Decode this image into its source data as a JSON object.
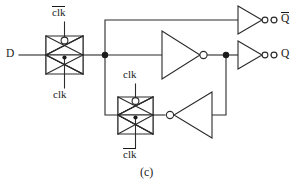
{
  "figure": {
    "caption": "(c)",
    "line_color": "#2b2b2b",
    "background": "#ffffff"
  },
  "labels": {
    "input_d": "D",
    "output_q": "Q",
    "output_qbar": "Q",
    "clk": "clk",
    "clk_bar": "clk"
  },
  "devices": [
    {
      "name": "input-transmission-gate",
      "type": "transmission-gate",
      "top_control": "clk_bar",
      "bottom_control": "clk",
      "top_label": "clk",
      "top_label_overbar": true,
      "bottom_label": "clk",
      "bottom_label_overbar": false
    },
    {
      "name": "feedback-transmission-gate",
      "type": "transmission-gate",
      "top_control": "clk",
      "bottom_control": "clk_bar",
      "top_label": "clk",
      "top_label_overbar": false,
      "bottom_label": "clk",
      "bottom_label_overbar": true
    },
    {
      "name": "main-inverter",
      "type": "inverter",
      "orientation": "right",
      "output_label": "Q"
    },
    {
      "name": "feedback-inverter",
      "type": "inverter",
      "orientation": "left",
      "output_label": ""
    },
    {
      "name": "qbar-output-inverter",
      "type": "inverter",
      "orientation": "right",
      "output_label": "Q-bar"
    },
    {
      "name": "q-output-inverter",
      "type": "inverter",
      "orientation": "right",
      "output_label": "Q"
    }
  ],
  "nodes": [
    {
      "name": "storage-node-left",
      "x": 105,
      "y": 55
    },
    {
      "name": "storage-node-right",
      "x": 226,
      "y": 55
    }
  ]
}
